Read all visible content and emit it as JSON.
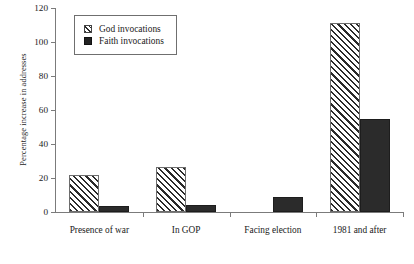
{
  "chart_data": {
    "type": "bar",
    "title": "",
    "xlabel": "",
    "ylabel": "Percentage increase in addresses",
    "categories": [
      "Presence of war",
      "In GOP",
      "Facing election",
      "1981 and after"
    ],
    "series": [
      {
        "name": "God invocations",
        "values": [
          22,
          26.5,
          0,
          111
        ]
      },
      {
        "name": "Faith invocations",
        "values": [
          3.5,
          4,
          9,
          55
        ]
      }
    ],
    "ylim": [
      0,
      120
    ],
    "yticks": [
      0,
      20,
      40,
      60,
      80,
      100,
      120
    ],
    "ytick_labels": [
      "0",
      "20",
      "40",
      "60",
      "80",
      "100",
      "120"
    ],
    "grid": false,
    "legend_position": "top-left",
    "colors": {
      "god": "#ffffff",
      "god_hatch": "#2b2b2b",
      "faith": "#2b2b2b",
      "axis": "#7b7b7b"
    }
  }
}
